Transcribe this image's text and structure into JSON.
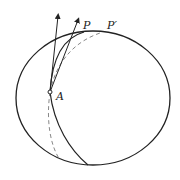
{
  "diagram": {
    "labels": {
      "point_a": "A",
      "point_p": "P",
      "point_p_prime": "P′"
    },
    "colors": {
      "stroke": "#222222",
      "dashed": "#888888",
      "background": "#ffffff"
    }
  }
}
